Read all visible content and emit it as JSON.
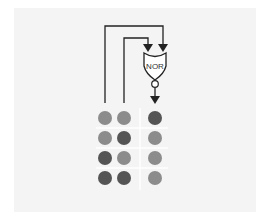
{
  "diagram": {
    "gate_label": "NOR",
    "colors": {
      "low": "#8c8c8c",
      "high": "#555555",
      "line": "#222222",
      "panel": "#f4f4f4",
      "grid": "#ffffff"
    },
    "truth_table": {
      "columns": [
        "input_a",
        "input_b",
        "output"
      ],
      "rows": [
        {
          "a": 0,
          "b": 0,
          "out": 1
        },
        {
          "a": 0,
          "b": 1,
          "out": 0
        },
        {
          "a": 1,
          "b": 0,
          "out": 0
        },
        {
          "a": 1,
          "b": 1,
          "out": 0
        }
      ]
    }
  }
}
